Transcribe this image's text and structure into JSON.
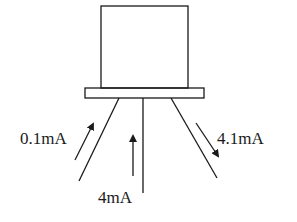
{
  "diagram": {
    "type": "transistor-current-diagram",
    "component": {
      "body": {
        "x": 101,
        "y": 6,
        "width": 87,
        "height": 82
      },
      "base_plate": {
        "x": 85,
        "y": 88,
        "width": 119,
        "height": 10
      }
    },
    "leads": [
      {
        "id": "left",
        "x1": 119,
        "y1": 98,
        "x2": 79,
        "y2": 181
      },
      {
        "id": "middle",
        "x1": 143,
        "y1": 98,
        "x2": 143,
        "y2": 193
      },
      {
        "id": "right",
        "x1": 171,
        "y1": 98,
        "x2": 217,
        "y2": 178
      }
    ],
    "arrows": [
      {
        "id": "left-arrow",
        "direction": "up",
        "x1": 75,
        "y1": 160,
        "x2": 93,
        "y2": 124
      },
      {
        "id": "middle-arrow",
        "direction": "up",
        "x1": 133,
        "y1": 176,
        "x2": 133,
        "y2": 136
      },
      {
        "id": "right-arrow",
        "direction": "down",
        "x1": 196,
        "y1": 123,
        "x2": 218,
        "y2": 156
      }
    ],
    "labels": {
      "left_current": "0.1mA",
      "middle_current": "4mA",
      "right_current": "4.1mA"
    },
    "label_positions": {
      "left_current": {
        "x": 20,
        "y": 144
      },
      "middle_current": {
        "x": 98,
        "y": 203
      },
      "right_current": {
        "x": 217,
        "y": 144
      }
    },
    "colors": {
      "line": "#1a1a1a",
      "background": "#ffffff"
    }
  }
}
